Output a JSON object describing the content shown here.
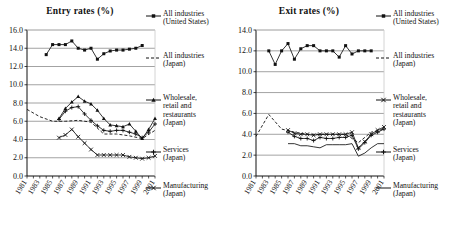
{
  "charts": [
    {
      "id": "entry",
      "title": "Entry rates (%)",
      "legend": [
        {
          "label": "All industries\n(United States)",
          "style": "solid-square"
        },
        {
          "label": "All industries\n(Japan)",
          "style": "dashed-plain"
        },
        {
          "label": "Wholesale,\nretail and\nrestaurants\n(Japan)",
          "style": "solid-triangle"
        },
        {
          "label": "Services\n(Japan)",
          "style": "solid-plus"
        },
        {
          "label": "Manufacturing\n(Japan)",
          "style": "solid-x"
        }
      ]
    },
    {
      "id": "exit",
      "title": "Exit rates (%)",
      "legend": [
        {
          "label": "All industries\n(United States)",
          "style": "solid-square"
        },
        {
          "label": "All industries\n(Japan)",
          "style": "dashed-plain"
        },
        {
          "label": "Wholesale,\nretail and\nrestaurants\n(Japan)",
          "style": "solid-x"
        },
        {
          "label": "Services\n(Japan)",
          "style": "solid-plus"
        },
        {
          "label": "Manufacturing\n(Japan)",
          "style": "solid-line"
        }
      ]
    }
  ],
  "chart_data": [
    {
      "type": "line",
      "title": "Entry rates (%)",
      "xlabel": "",
      "ylabel": "",
      "ylim": [
        0.0,
        16.0
      ],
      "yticks": [
        "0.0",
        "2.0",
        "4.0",
        "6.0",
        "8.0",
        "10.0",
        "12.0",
        "14.0",
        "16.0"
      ],
      "xlim": [
        1981,
        2001
      ],
      "x": [
        1981,
        1982,
        1983,
        1984,
        1985,
        1986,
        1987,
        1988,
        1989,
        1990,
        1991,
        1992,
        1993,
        1994,
        1995,
        1996,
        1997,
        1998,
        1999,
        2000,
        2001
      ],
      "xticks": [
        "1981",
        "1983",
        "1985",
        "1987",
        "1989",
        "1991",
        "1993",
        "1995",
        "1997",
        "1999",
        "2001"
      ],
      "grid": true,
      "legend_position": "right",
      "series": [
        {
          "name": "All industries (United States)",
          "style": "solid-square",
          "x": [
            1984,
            1985,
            1986,
            1987,
            1988,
            1989,
            1990,
            1991,
            1992,
            1993,
            1994,
            1995,
            1996,
            1997,
            1998,
            1999
          ],
          "values": [
            13.3,
            14.4,
            14.4,
            14.4,
            14.8,
            14.0,
            13.8,
            14.0,
            12.8,
            13.4,
            13.7,
            13.8,
            13.8,
            13.9,
            14.0,
            14.3
          ]
        },
        {
          "name": "All industries (Japan)",
          "style": "dashed-plain",
          "x": [
            1981,
            1983,
            1985,
            1987,
            1989,
            1991,
            1993,
            1995,
            1997,
            1999,
            2001
          ],
          "values": [
            7.3,
            6.5,
            6.0,
            6.0,
            6.1,
            5.9,
            4.6,
            4.6,
            4.4,
            4.1,
            5.0
          ]
        },
        {
          "name": "Wholesale, retail and restaurants (Japan)",
          "style": "solid-triangle",
          "x": [
            1986,
            1987,
            1988,
            1989,
            1990,
            1991,
            1992,
            1993,
            1994,
            1995,
            1996,
            1997,
            1998,
            1999,
            2000,
            2001
          ],
          "values": [
            6.3,
            7.4,
            8.1,
            8.7,
            8.2,
            7.9,
            7.2,
            6.3,
            5.6,
            5.5,
            5.4,
            5.7,
            4.9,
            4.1,
            5.1,
            6.3
          ]
        },
        {
          "name": "Services (Japan)",
          "style": "solid-plus",
          "x": [
            1986,
            1987,
            1988,
            1989,
            1990,
            1991,
            1992,
            1993,
            1994,
            1995,
            1996,
            1997,
            1998,
            1999,
            2000,
            2001
          ],
          "values": [
            6.2,
            7.1,
            7.5,
            7.6,
            6.8,
            6.1,
            5.5,
            5.0,
            4.9,
            5.0,
            5.0,
            4.8,
            4.6,
            4.2,
            4.8,
            5.7
          ]
        },
        {
          "name": "Manufacturing (Japan)",
          "style": "solid-x",
          "x": [
            1986,
            1987,
            1988,
            1989,
            1990,
            1991,
            1992,
            1993,
            1994,
            1995,
            1996,
            1997,
            1998,
            1999,
            2000,
            2001
          ],
          "values": [
            4.2,
            4.5,
            5.1,
            4.3,
            3.6,
            2.9,
            2.3,
            2.3,
            2.3,
            2.3,
            2.3,
            2.1,
            2.0,
            1.9,
            2.0,
            2.2
          ]
        }
      ]
    },
    {
      "type": "line",
      "title": "Exit rates (%)",
      "xlabel": "",
      "ylabel": "",
      "ylim": [
        0.0,
        14.0
      ],
      "yticks": [
        "0.0",
        "2.0",
        "4.0",
        "6.0",
        "8.0",
        "10.0",
        "12.0",
        "14.0"
      ],
      "xlim": [
        1981,
        2001
      ],
      "x": [
        1981,
        1982,
        1983,
        1984,
        1985,
        1986,
        1987,
        1988,
        1989,
        1990,
        1991,
        1992,
        1993,
        1994,
        1995,
        1996,
        1997,
        1998,
        1999,
        2000,
        2001
      ],
      "xticks": [
        "1981",
        "1983",
        "1985",
        "1987",
        "1989",
        "1991",
        "1993",
        "1995",
        "1997",
        "1999",
        "2001"
      ],
      "grid": true,
      "legend_position": "right",
      "series": [
        {
          "name": "All industries (United States)",
          "style": "solid-square",
          "x": [
            1983,
            1984,
            1985,
            1986,
            1987,
            1988,
            1989,
            1990,
            1991,
            1992,
            1993,
            1994,
            1995,
            1996,
            1997,
            1998,
            1999
          ],
          "values": [
            12.0,
            10.7,
            12.0,
            12.7,
            11.2,
            12.2,
            12.5,
            12.5,
            12.0,
            12.0,
            12.0,
            11.4,
            12.5,
            11.7,
            12.0,
            12.0,
            12.0
          ]
        },
        {
          "name": "All industries (Japan)",
          "style": "dashed-plain",
          "x": [
            1981,
            1983,
            1985,
            1987,
            1989,
            1991,
            1993,
            1995,
            1997,
            1999,
            2001
          ],
          "values": [
            3.8,
            5.9,
            4.5,
            4.2,
            4.0,
            4.0,
            4.0,
            4.0,
            3.2,
            4.2,
            4.5
          ]
        },
        {
          "name": "Wholesale, retail and restaurants (Japan)",
          "style": "solid-x",
          "x": [
            1986,
            1987,
            1988,
            1989,
            1990,
            1991,
            1992,
            1993,
            1994,
            1995,
            1996,
            1997,
            1998,
            1999,
            2000,
            2001
          ],
          "values": [
            4.4,
            4.1,
            4.0,
            4.0,
            3.9,
            4.0,
            4.0,
            4.0,
            4.0,
            4.0,
            4.2,
            2.7,
            3.3,
            4.0,
            4.4,
            4.7
          ]
        },
        {
          "name": "Services (Japan)",
          "style": "solid-plus",
          "x": [
            1986,
            1987,
            1988,
            1989,
            1990,
            1991,
            1992,
            1993,
            1994,
            1995,
            1996,
            1997,
            1998,
            1999,
            2000,
            2001
          ],
          "values": [
            4.2,
            3.8,
            3.6,
            3.6,
            3.4,
            3.7,
            3.6,
            3.6,
            3.7,
            3.7,
            3.9,
            2.6,
            3.2,
            3.9,
            4.2,
            4.5
          ]
        },
        {
          "name": "Manufacturing (Japan)",
          "style": "solid-line",
          "x": [
            1986,
            1987,
            1988,
            1989,
            1990,
            1991,
            1992,
            1993,
            1994,
            1995,
            1996,
            1997,
            1998,
            1999,
            2000,
            2001
          ],
          "values": [
            3.1,
            3.1,
            2.9,
            2.9,
            2.8,
            2.7,
            3.0,
            3.0,
            3.0,
            3.0,
            3.1,
            1.9,
            2.2,
            2.7,
            3.1,
            3.1
          ]
        }
      ]
    }
  ]
}
